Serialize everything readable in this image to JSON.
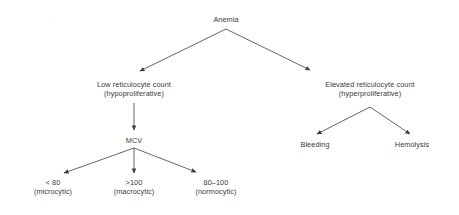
{
  "diagram": {
    "text_color": "#3a3a3a",
    "edge_color": "#4a4a4a",
    "background": "#ffffff",
    "nodes": {
      "root": {
        "label": "Anemia"
      },
      "low_retic": {
        "line1": "Low reticulocyte count",
        "line2": "(hypoproliferative)"
      },
      "elevated_retic": {
        "line1": "Elevated reticulocyte count",
        "line2": "(hyperproliferative)"
      },
      "mcv": {
        "label": "MCV"
      },
      "microcytic": {
        "line1": "< 80",
        "line2": "(microcytic)"
      },
      "macrocytic": {
        "line1": ">100",
        "line2": "(macrocytic)"
      },
      "normocytic": {
        "line1": "80–100",
        "line2": "(normocytic)"
      },
      "bleeding": {
        "label": "Bleeding"
      },
      "hemolysis": {
        "label": "Hemolysis"
      }
    }
  }
}
